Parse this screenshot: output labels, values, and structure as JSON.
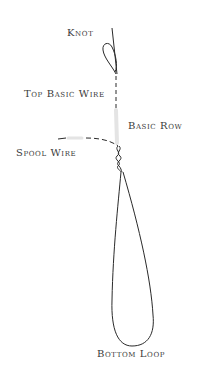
{
  "diagram": {
    "labels": {
      "knot": "Knot",
      "top_basic_wire": "Top Basic Wire",
      "basic_row": "Basic Row",
      "spool_wire": "Spool Wire",
      "bottom_loop": "Bottom Loop"
    },
    "colors": {
      "wire": "#2a2a2a",
      "faint_wire": "#e4e4e4",
      "label": "#3a3a3a",
      "background": "#ffffff"
    }
  }
}
